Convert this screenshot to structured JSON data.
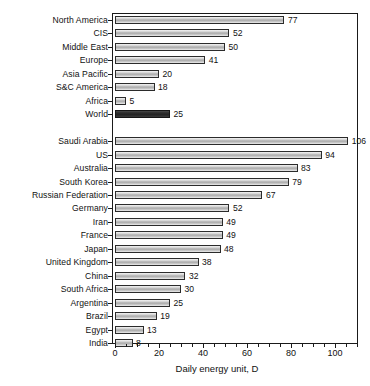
{
  "chart_data": {
    "type": "bar",
    "orientation": "horizontal",
    "title": "",
    "xlabel": "Daily energy unit, D",
    "ylabel": "",
    "xlim": [
      0,
      110
    ],
    "xticks": [
      0,
      20,
      40,
      60,
      80,
      100
    ],
    "xtick_labels": [
      "0",
      "20",
      "40",
      "60",
      "80",
      "100"
    ],
    "minor_tick_step": 5,
    "grid": false,
    "legend": null,
    "groups": [
      {
        "name": "regions",
        "categories": [
          "North America",
          "CIS",
          "Middle East",
          "Europe",
          "Asia Pacific",
          "S&C America",
          "Africa",
          "World"
        ],
        "values": [
          77,
          52,
          50,
          41,
          20,
          18,
          5,
          25
        ],
        "highlight_index": 7
      },
      {
        "name": "countries",
        "categories": [
          "Saudi Arabia",
          "US",
          "Australia",
          "South Korea",
          "Russian Federation",
          "Germany",
          "Iran",
          "France",
          "Japan",
          "United Kingdom",
          "China",
          "South Africa",
          "Argentina",
          "Brazil",
          "Egypt",
          "India"
        ],
        "values": [
          106,
          94,
          83,
          79,
          67,
          52,
          49,
          49,
          48,
          38,
          32,
          30,
          25,
          19,
          13,
          8
        ],
        "highlight_index": null
      }
    ],
    "categories": [
      "North America",
      "CIS",
      "Middle East",
      "Europe",
      "Asia Pacific",
      "S&C America",
      "Africa",
      "World",
      "Saudi Arabia",
      "US",
      "Australia",
      "South Korea",
      "Russian Federation",
      "Germany",
      "Iran",
      "France",
      "Japan",
      "United Kingdom",
      "China",
      "South Africa",
      "Argentina",
      "Brazil",
      "Egypt",
      "India"
    ],
    "values": [
      77,
      52,
      50,
      41,
      20,
      18,
      5,
      25,
      106,
      94,
      83,
      79,
      67,
      52,
      49,
      49,
      48,
      38,
      32,
      30,
      25,
      19,
      13,
      8
    ],
    "colors": {
      "bar_fill_light": "#c9c9c9",
      "bar_fill_dark": "#2e2e2e",
      "bar_border": "#2b2b2b",
      "axis": "#1a1a1a",
      "text": "#111111",
      "background": "#ffffff"
    }
  }
}
